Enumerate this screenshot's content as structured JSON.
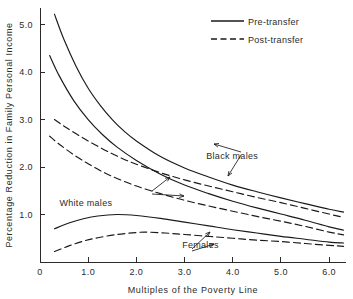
{
  "chart_data": {
    "type": "line",
    "title": "",
    "xlabel": "Multiples of the Poverty Line",
    "ylabel": "Percentage Reduction in Family Personal Income",
    "xlim": [
      0,
      6.35
    ],
    "ylim": [
      0,
      5.35
    ],
    "xticks": [
      0,
      1.0,
      2.0,
      3.0,
      4.0,
      5.0,
      6.0
    ],
    "xtick_labels": [
      "0",
      "1.0",
      "2.0",
      "3.0",
      "4.0",
      "5.0",
      "6.0"
    ],
    "yticks": [
      1.0,
      2.0,
      3.0,
      4.0,
      5.0
    ],
    "ytick_labels": [
      "1.0",
      "2.0",
      "3.0",
      "4.0",
      "5.0"
    ],
    "grid": false,
    "legend_position": "top-right",
    "legend": [
      {
        "label": "Pre-transfer",
        "style": "solid"
      },
      {
        "label": "Post-transfer",
        "style": "dashed"
      }
    ],
    "series": [
      {
        "name": "Black males pre-transfer",
        "group": "Black males",
        "style": "solid",
        "x": [
          0.3,
          0.5,
          0.75,
          1.0,
          1.25,
          1.5,
          1.75,
          2.0,
          2.5,
          3.0,
          3.5,
          4.0,
          4.5,
          5.0,
          5.5,
          6.0,
          6.3
        ],
        "y": [
          5.22,
          4.68,
          4.12,
          3.66,
          3.3,
          3.0,
          2.75,
          2.55,
          2.22,
          1.98,
          1.79,
          1.62,
          1.48,
          1.35,
          1.23,
          1.11,
          1.05
        ]
      },
      {
        "name": "Black males post-transfer",
        "group": "Black males",
        "style": "dashed",
        "x": [
          0.3,
          0.5,
          0.75,
          1.0,
          1.25,
          1.5,
          1.75,
          2.0,
          2.5,
          3.0,
          3.5,
          4.0,
          4.5,
          5.0,
          5.5,
          6.0,
          6.3
        ],
        "y": [
          3.0,
          2.86,
          2.7,
          2.55,
          2.41,
          2.28,
          2.16,
          2.06,
          1.88,
          1.73,
          1.6,
          1.48,
          1.36,
          1.25,
          1.13,
          1.01,
          0.94
        ]
      },
      {
        "name": "White males pre-transfer",
        "group": "White males",
        "style": "solid",
        "x": [
          0.2,
          0.4,
          0.7,
          1.0,
          1.3,
          1.6,
          2.0,
          2.5,
          3.0,
          3.5,
          4.0,
          4.5,
          5.0,
          5.5,
          6.0,
          6.3
        ],
        "y": [
          4.35,
          3.92,
          3.4,
          3.0,
          2.68,
          2.42,
          2.14,
          1.85,
          1.62,
          1.44,
          1.28,
          1.14,
          1.01,
          0.88,
          0.74,
          0.67
        ]
      },
      {
        "name": "White males post-transfer",
        "group": "White males",
        "style": "dashed",
        "x": [
          0.2,
          0.4,
          0.7,
          1.0,
          1.3,
          1.6,
          2.0,
          2.5,
          3.0,
          3.5,
          4.0,
          4.5,
          5.0,
          5.5,
          6.0,
          6.3
        ],
        "y": [
          2.65,
          2.48,
          2.26,
          2.07,
          1.9,
          1.76,
          1.6,
          1.44,
          1.3,
          1.18,
          1.07,
          0.96,
          0.86,
          0.75,
          0.63,
          0.57
        ]
      },
      {
        "name": "Females pre-transfer",
        "group": "Females",
        "style": "solid",
        "x": [
          0.3,
          0.6,
          0.9,
          1.2,
          1.6,
          2.0,
          2.5,
          3.0,
          3.5,
          4.0,
          4.5,
          5.0,
          5.5,
          6.0,
          6.3
        ],
        "y": [
          0.7,
          0.82,
          0.91,
          0.97,
          1.0,
          0.98,
          0.92,
          0.84,
          0.76,
          0.68,
          0.61,
          0.54,
          0.48,
          0.42,
          0.4
        ]
      },
      {
        "name": "Females post-transfer",
        "group": "Females",
        "style": "dashed",
        "x": [
          0.3,
          0.6,
          0.9,
          1.2,
          1.6,
          2.0,
          2.2,
          2.6,
          3.0,
          3.5,
          4.0,
          4.5,
          5.0,
          5.5,
          6.0,
          6.3
        ],
        "y": [
          0.22,
          0.34,
          0.44,
          0.51,
          0.58,
          0.62,
          0.63,
          0.61,
          0.58,
          0.54,
          0.5,
          0.46,
          0.43,
          0.39,
          0.35,
          0.33
        ]
      }
    ],
    "annotations": [
      {
        "label": "Black males",
        "x": 3.45,
        "y": 2.17
      },
      {
        "label": "White males",
        "x": 1.5,
        "y": 1.17
      },
      {
        "label": "Females",
        "x": 2.95,
        "y": 0.3
      }
    ]
  },
  "axes": {
    "x_title": "Multiples of the Poverty Line",
    "y_title": "Percentage Reduction in Family Personal Income"
  },
  "legend": {
    "pre_label": "Pre-transfer",
    "post_label": "Post-transfer"
  },
  "annotations": {
    "black_males": "Black males",
    "white_males": "White males",
    "females": "Females"
  },
  "colors": {
    "ink": "#1a1a1a",
    "axis": "#2b2b2b",
    "background": "#ffffff"
  }
}
